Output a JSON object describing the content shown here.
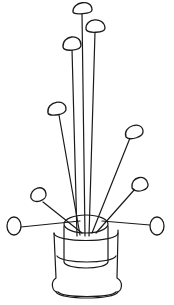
{
  "illustration": {
    "subject": "line drawing of a potted plant with round-headed stems",
    "stroke_color": "#1a1a1a",
    "background_color": "#ffffff",
    "flower_count": 9
  }
}
